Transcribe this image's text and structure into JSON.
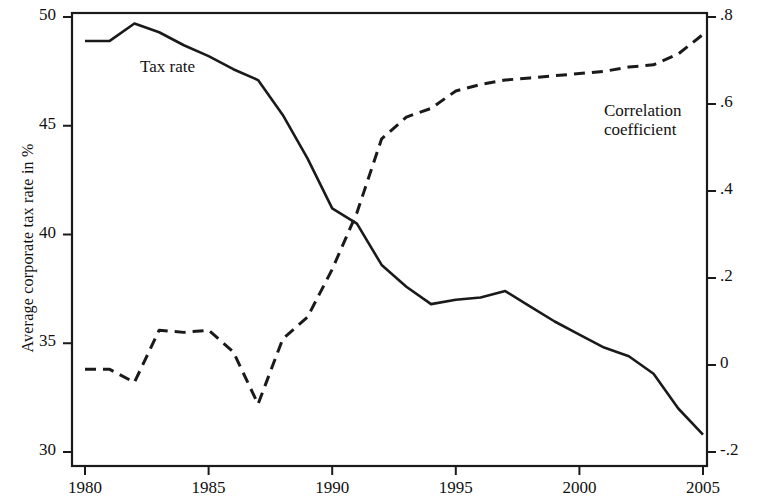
{
  "chart_data": {
    "type": "line",
    "title": "",
    "subtitle": "",
    "xlabel": "",
    "ylabel": "Average corporate tax rate in %",
    "ylabel_right": "Correlation coefficient for tax rate and country size",
    "xlim": [
      1980,
      2005
    ],
    "ylim": [
      30,
      50
    ],
    "ylim_right": [
      -0.2,
      0.8
    ],
    "xticks": [
      "1980",
      "1985",
      "1990",
      "1995",
      "2000",
      "2005"
    ],
    "xtick_values": [
      1980,
      1985,
      1990,
      1995,
      2000,
      2005
    ],
    "yticks_left": [
      "30",
      "35",
      "40",
      "45",
      "50"
    ],
    "ytick_values_left": [
      30,
      35,
      40,
      45,
      50
    ],
    "yticks_right": [
      "-.2",
      "0",
      ".2",
      ".4",
      ".6",
      ".8"
    ],
    "ytick_values_right": [
      -0.2,
      0,
      0.2,
      0.4,
      0.6,
      0.8
    ],
    "grid": false,
    "legend_position": "inline-annotations",
    "x": [
      1980,
      1981,
      1982,
      1983,
      1984,
      1985,
      1986,
      1987,
      1988,
      1989,
      1990,
      1991,
      1992,
      1993,
      1994,
      1995,
      1996,
      1997,
      1998,
      1999,
      2000,
      2001,
      2002,
      2003,
      2004,
      2005
    ],
    "series": [
      {
        "name": "Tax rate",
        "axis": "left",
        "style": "solid",
        "color": "#1a1a1a",
        "values": [
          48.9,
          48.9,
          49.7,
          49.3,
          48.7,
          48.2,
          47.6,
          47.1,
          45.5,
          43.5,
          41.2,
          40.5,
          38.6,
          37.6,
          36.8,
          37.0,
          37.1,
          37.4,
          36.7,
          36.0,
          35.4,
          34.8,
          34.4,
          33.6,
          32.0,
          30.8
        ]
      },
      {
        "name": "Correlation coefficient",
        "axis": "right",
        "style": "dashed",
        "color": "#1a1a1a",
        "values": [
          -0.01,
          -0.01,
          -0.04,
          0.08,
          0.075,
          0.08,
          0.03,
          -0.09,
          0.06,
          0.11,
          0.22,
          0.35,
          0.52,
          0.57,
          0.59,
          0.63,
          0.645,
          0.655,
          0.66,
          0.665,
          0.67,
          0.675,
          0.685,
          0.69,
          0.715,
          0.76
        ]
      }
    ],
    "annotations": [
      {
        "text": "Tax rate",
        "x": 1982.6,
        "y": 47.2,
        "axis": "left"
      },
      {
        "text": "Correlation\ncoefficient",
        "x": 2000.4,
        "y": 0.59,
        "axis": "right"
      }
    ]
  },
  "annotation_labels": {
    "tax_rate": "Tax rate",
    "correlation_line1": "Correlation",
    "correlation_line2": "coefficient"
  }
}
